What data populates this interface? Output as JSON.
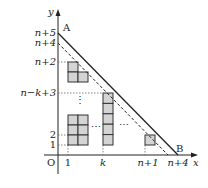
{
  "diagram": {
    "axes": {
      "x_label": "x",
      "y_label": "y",
      "origin_label": "O"
    },
    "points": {
      "A": "A",
      "B": "B"
    },
    "y_ticks": [
      "n+5",
      "n+4",
      "n+2",
      "n−k+3",
      "2",
      "1"
    ],
    "x_ticks": [
      "1",
      "k",
      "n+1",
      "n+4"
    ],
    "ellipsis": "⋯",
    "vdots": "⋮",
    "colors": {
      "fill": "#d4d4d4",
      "stroke": "#333333",
      "line": "#222222"
    }
  }
}
